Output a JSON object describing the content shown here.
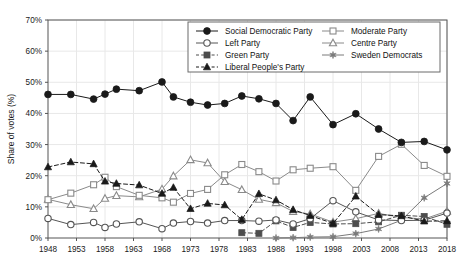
{
  "chart_data": {
    "type": "line",
    "title": "",
    "subtitle": "",
    "xlabel": "",
    "ylabel": "Share of votes (%)",
    "ylim": [
      0,
      70
    ],
    "xlim": [
      1948,
      2018
    ],
    "y_ticks": [
      "0%",
      "10%",
      "20%",
      "30%",
      "40%",
      "50%",
      "60%",
      "70%"
    ],
    "y_tick_values": [
      0,
      10,
      20,
      30,
      40,
      50,
      60,
      70
    ],
    "x_ticks": [
      "1948",
      "1953",
      "1958",
      "1963",
      "1968",
      "1973",
      "1978",
      "1983",
      "1988",
      "1993",
      "1998",
      "2003",
      "2008",
      "2013",
      "2018"
    ],
    "x_tick_values": [
      1948,
      1953,
      1958,
      1963,
      1968,
      1973,
      1978,
      1983,
      1988,
      1993,
      1998,
      2003,
      2008,
      2013,
      2018
    ],
    "grid": true,
    "grid_axis": "both",
    "legend_position": "top-right",
    "x": [
      1948,
      1952,
      1956,
      1958,
      1960,
      1964,
      1968,
      1970,
      1973,
      1976,
      1979,
      1982,
      1985,
      1988,
      1991,
      1994,
      1998,
      2002,
      2006,
      2010,
      2014,
      2018
    ],
    "series": [
      {
        "name": "Social Democratic Party",
        "marker": "filled-circle",
        "line_style": "solid",
        "color": "#1a1a1a",
        "values": [
          46.1,
          46.1,
          44.6,
          46.2,
          47.8,
          47.3,
          50.1,
          45.3,
          43.6,
          42.7,
          43.2,
          45.6,
          44.7,
          43.2,
          37.7,
          45.3,
          36.4,
          39.9,
          35.0,
          30.7,
          31.0,
          28.3
        ]
      },
      {
        "name": "Left Party",
        "marker": "open-circle",
        "line_style": "solid",
        "color": "#555555",
        "values": [
          6.3,
          4.3,
          5.0,
          3.4,
          4.5,
          5.2,
          3.0,
          4.8,
          5.3,
          4.8,
          5.6,
          5.6,
          5.4,
          5.8,
          4.5,
          6.2,
          12.0,
          8.4,
          5.8,
          5.6,
          5.7,
          8.0
        ]
      },
      {
        "name": "Green Party",
        "marker": "filled-square",
        "line_style": "dashed",
        "color": "#4d4d4d",
        "values": [
          null,
          null,
          null,
          null,
          null,
          null,
          null,
          null,
          null,
          null,
          null,
          1.7,
          1.5,
          5.5,
          3.4,
          5.0,
          4.5,
          4.6,
          5.2,
          7.3,
          6.9,
          4.4
        ]
      },
      {
        "name": "Liberal People's Party",
        "marker": "filled-triangle",
        "line_style": "dashed",
        "color": "#1a1a1a",
        "values": [
          22.8,
          24.4,
          23.8,
          18.2,
          17.5,
          17.0,
          14.3,
          16.2,
          9.4,
          11.1,
          10.6,
          5.9,
          14.2,
          12.2,
          9.1,
          7.2,
          4.7,
          13.4,
          7.5,
          7.1,
          5.4,
          5.5
        ]
      },
      {
        "name": "Moderate Party",
        "marker": "open-square",
        "line_style": "solid",
        "color": "#8a8a8a",
        "values": [
          12.3,
          14.4,
          17.1,
          19.5,
          16.5,
          13.7,
          12.9,
          11.5,
          14.3,
          15.6,
          20.3,
          23.6,
          21.3,
          18.3,
          21.9,
          22.4,
          22.9,
          15.3,
          26.2,
          30.1,
          23.3,
          19.8
        ]
      },
      {
        "name": "Centre Party",
        "marker": "open-triangle",
        "line_style": "solid",
        "color": "#8a8a8a",
        "values": [
          12.4,
          10.7,
          9.4,
          12.7,
          13.6,
          13.2,
          15.7,
          19.9,
          25.1,
          24.1,
          18.1,
          15.5,
          12.4,
          11.3,
          8.5,
          7.7,
          5.1,
          6.2,
          7.9,
          6.6,
          6.1,
          8.6
        ]
      },
      {
        "name": "Sweden Democrats",
        "marker": "star",
        "line_style": "solid",
        "color": "#7a7a7a",
        "values": [
          null,
          null,
          null,
          null,
          null,
          null,
          null,
          null,
          null,
          null,
          null,
          null,
          null,
          0.0,
          0.1,
          0.3,
          0.4,
          1.4,
          2.9,
          5.7,
          12.9,
          17.5
        ]
      }
    ]
  },
  "legend": {
    "entries": [
      {
        "label": "Social Democratic Party",
        "marker": "filled-circle"
      },
      {
        "label": "Left Party",
        "marker": "open-circle"
      },
      {
        "label": "Green Party",
        "marker": "filled-square"
      },
      {
        "label": "Liberal People's Party",
        "marker": "filled-triangle"
      },
      {
        "label": "Moderate Party",
        "marker": "open-square"
      },
      {
        "label": "Centre Party",
        "marker": "open-triangle"
      },
      {
        "label": "Sweden Democrats",
        "marker": "star"
      }
    ]
  },
  "colors": {
    "axis": "#555555",
    "grid": "#e8e8e8",
    "background": "#ffffff",
    "text": "#1a1a1a"
  }
}
